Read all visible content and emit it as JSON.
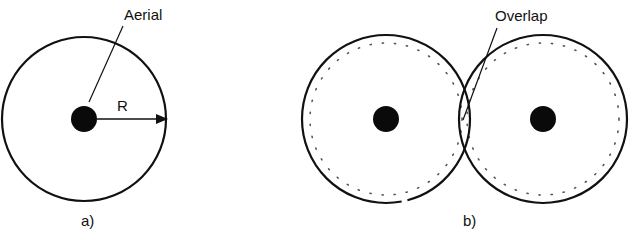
{
  "diagram": {
    "colors": {
      "stroke": "#111111",
      "background": "#ffffff",
      "dots": "#555555"
    },
    "panel_a": {
      "caption": "a)",
      "aerial_label": "Aerial",
      "radius_label": "R",
      "circle": {
        "cx": 84,
        "cy": 119,
        "r": 82
      },
      "aerial": {
        "cx": 84,
        "cy": 119,
        "r": 13
      }
    },
    "panel_b": {
      "caption": "b)",
      "overlap_label": "Overlap",
      "circles": [
        {
          "cx": 386,
          "cy": 119,
          "r": 84,
          "inner_dotted_r": 76
        },
        {
          "cx": 543,
          "cy": 119,
          "r": 84,
          "inner_dotted_r": 76
        }
      ],
      "aerials": [
        {
          "cx": 386,
          "cy": 119,
          "r": 13
        },
        {
          "cx": 543,
          "cy": 119,
          "r": 13
        }
      ]
    }
  }
}
